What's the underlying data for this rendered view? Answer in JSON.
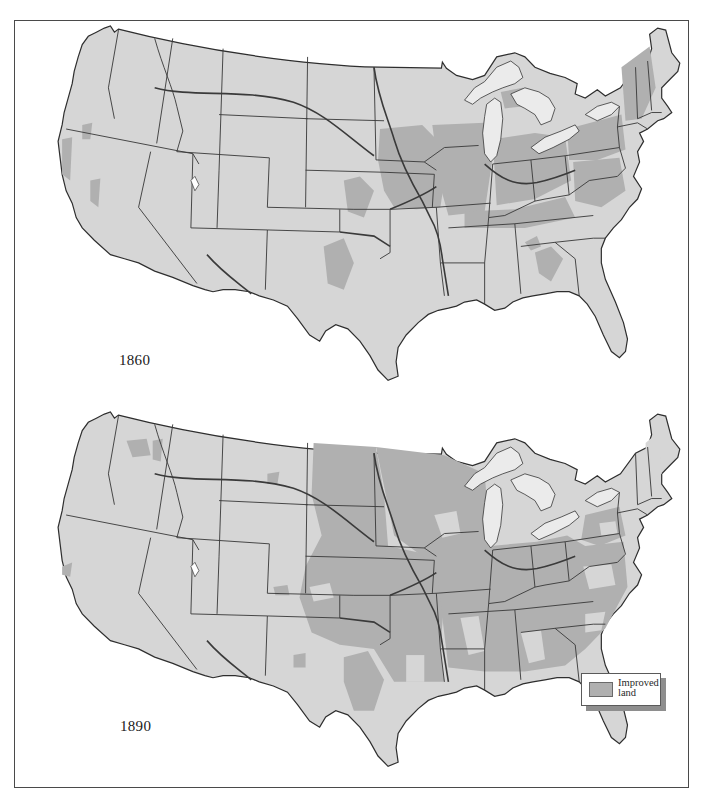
{
  "map": {
    "title": "Improved land in the United States, 1860 and 1890",
    "panels": [
      {
        "year_label": "1860"
      },
      {
        "year_label": "1890"
      }
    ],
    "legend": {
      "items": [
        {
          "label": "Improved land",
          "color": "#b0b0b0",
          "icon": "swatch-icon"
        }
      ]
    },
    "colors": {
      "land": "#d6d6d6",
      "improved_land": "#b0b0b0",
      "water_lakes": "#ebebeb",
      "ocean": "#ffffff",
      "borders": "#3a3a3a",
      "frame": "#4a4a4a"
    }
  }
}
